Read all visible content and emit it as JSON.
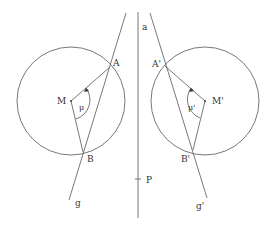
{
  "diagram": {
    "stroke_color": "#555555",
    "left": {
      "center_label": "M",
      "point_a_label": "A",
      "point_b_label": "B",
      "angle_label": "μ",
      "line_label": "g"
    },
    "right": {
      "center_label": "M'",
      "point_a_label": "A'",
      "point_b_label": "B'",
      "angle_label": "μ'",
      "line_label": "g'"
    },
    "axis": {
      "line_label": "a",
      "point_label": "P"
    }
  }
}
